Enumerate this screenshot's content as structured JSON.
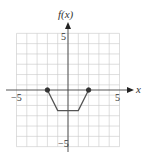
{
  "chart_data": {
    "type": "line",
    "title": "",
    "xlabel": "x",
    "ylabel": "f(x)",
    "xlim": [
      -5,
      5
    ],
    "ylim": [
      -5,
      5
    ],
    "grid": true,
    "x_tick_labels": [
      "-5",
      "5"
    ],
    "y_tick_labels": [
      "5",
      "-5"
    ],
    "series": [
      {
        "name": "f(x)",
        "x": [
          -2,
          -1,
          1,
          2
        ],
        "y": [
          0,
          -2,
          -2,
          0
        ]
      }
    ],
    "endpoints": [
      {
        "x": -2,
        "y": 0,
        "closed": true
      },
      {
        "x": 2,
        "y": 0,
        "closed": true
      }
    ],
    "line_color": "#555555"
  },
  "labels": {
    "y_axis": "f(x)",
    "x_axis": "x",
    "x_neg": "−5",
    "x_pos": "5",
    "y_pos": "5",
    "y_neg": "−5"
  }
}
